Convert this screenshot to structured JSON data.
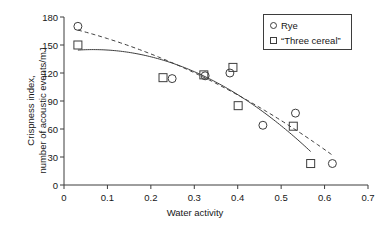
{
  "chart_data": {
    "type": "scatter",
    "title": "",
    "xlabel": "Water activity",
    "ylabel": "Crispness index, number of acoustic events/mJ",
    "ylabel_line1": "Crispness index,",
    "ylabel_line2": "number of acoustic events/mJ",
    "xlim": [
      0,
      0.7
    ],
    "ylim": [
      0,
      180
    ],
    "xticks": [
      0,
      0.1,
      0.2,
      0.3,
      0.4,
      0.5,
      0.6,
      0.7
    ],
    "xtick_labels": [
      "0",
      "0.1",
      "0.2",
      "0.3",
      "0.4",
      "0.5",
      "0.6",
      "0.7"
    ],
    "yticks": [
      0,
      30,
      60,
      90,
      120,
      150,
      180
    ],
    "ytick_labels": [
      "0",
      "30",
      "60",
      "90",
      "120",
      "150",
      "180"
    ],
    "grid": false,
    "legend_position": "top-right",
    "series": [
      {
        "name": "Rye",
        "marker": "circle",
        "fit_line": "dashed",
        "color": "#3d3d3d",
        "points": [
          {
            "x": 0.032,
            "y": 170
          },
          {
            "x": 0.249,
            "y": 114
          },
          {
            "x": 0.325,
            "y": 117
          },
          {
            "x": 0.382,
            "y": 120
          },
          {
            "x": 0.458,
            "y": 64
          },
          {
            "x": 0.533,
            "y": 77
          },
          {
            "x": 0.618,
            "y": 23
          }
        ]
      },
      {
        "name": "“Three cereal”",
        "marker": "square",
        "fit_line": "solid",
        "color": "#3d3d3d",
        "points": [
          {
            "x": 0.032,
            "y": 150
          },
          {
            "x": 0.228,
            "y": 115
          },
          {
            "x": 0.322,
            "y": 118
          },
          {
            "x": 0.389,
            "y": 126
          },
          {
            "x": 0.401,
            "y": 85
          },
          {
            "x": 0.528,
            "y": 63
          },
          {
            "x": 0.568,
            "y": 23
          }
        ]
      }
    ]
  },
  "legend": {
    "entries": [
      {
        "label": "Rye",
        "marker": "circle"
      },
      {
        "label": "“Three cereal”",
        "marker": "square"
      }
    ]
  }
}
